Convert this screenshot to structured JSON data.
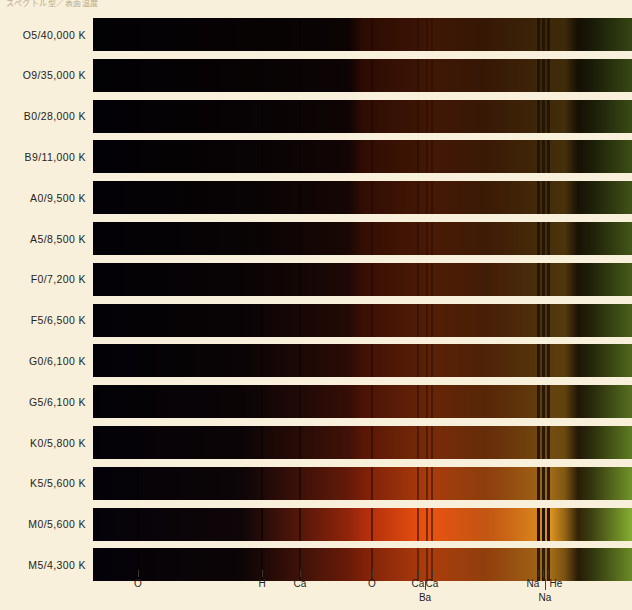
{
  "header": {
    "cropped_text": "スペクトル型／表面温度"
  },
  "chart_data": {
    "type": "heatmap",
    "xlabel": "",
    "ylabel": "Spectral type / Surface temperature",
    "grid": false,
    "legend": "none",
    "wavelength_axis_note": "violet (left) to red/green rendering (right)",
    "categories": [
      "O5/40,000 K",
      "O9/35,000 K",
      "B0/28,000 K",
      "B9/11,000 K",
      "A0/9,500 K",
      "A5/8,500 K",
      "F0/7,200 K",
      "F5/6,500 K",
      "G0/6,100 K",
      "G5/6,100 K",
      "K0/5,800 K",
      "K5/5,600 K",
      "M0/5,600 K",
      "M5/4,300 K"
    ],
    "absorption_lines": [
      {
        "element": "O",
        "x": 138,
        "row": 1
      },
      {
        "element": "H",
        "x": 262,
        "row": 1
      },
      {
        "element": "Ca",
        "x": 300,
        "row": 1
      },
      {
        "element": "O",
        "x": 372,
        "row": 1
      },
      {
        "element": "Ca",
        "x": 418,
        "row": 1
      },
      {
        "element": "Ca",
        "x": 432,
        "row": 1
      },
      {
        "element": "Ba",
        "x": 425,
        "row": 2
      },
      {
        "element": "Na",
        "x": 533,
        "row": 1
      },
      {
        "element": "He",
        "x": 556,
        "row": 1
      },
      {
        "element": "Na",
        "x": 545,
        "row": 2
      }
    ],
    "tick_positions": [
      138,
      262,
      300,
      372,
      418,
      427,
      432,
      538,
      543,
      548
    ],
    "series": [
      {
        "name": "O5/40,000 K",
        "temperature_k": 40000,
        "class": "O5",
        "brightness": 0.14,
        "red_strength": 0.1
      },
      {
        "name": "O9/35,000 K",
        "temperature_k": 35000,
        "class": "O9",
        "brightness": 0.16,
        "red_strength": 0.12
      },
      {
        "name": "B0/28,000 K",
        "temperature_k": 28000,
        "class": "B0",
        "brightness": 0.18,
        "red_strength": 0.14
      },
      {
        "name": "B9/11,000 K",
        "temperature_k": 11000,
        "class": "B9",
        "brightness": 0.21,
        "red_strength": 0.18
      },
      {
        "name": "A0/9,500 K",
        "temperature_k": 9500,
        "class": "A0",
        "brightness": 0.24,
        "red_strength": 0.22
      },
      {
        "name": "A5/8,500 K",
        "temperature_k": 8500,
        "class": "A5",
        "brightness": 0.27,
        "red_strength": 0.26
      },
      {
        "name": "F0/7,200 K",
        "temperature_k": 7200,
        "class": "F0",
        "brightness": 0.31,
        "red_strength": 0.31
      },
      {
        "name": "F5/6,500 K",
        "temperature_k": 6500,
        "class": "F5",
        "brightness": 0.35,
        "red_strength": 0.36
      },
      {
        "name": "G0/6,100 K",
        "temperature_k": 6100,
        "class": "G0",
        "brightness": 0.4,
        "red_strength": 0.42
      },
      {
        "name": "G5/6,100 K",
        "temperature_k": 6100,
        "class": "G5",
        "brightness": 0.46,
        "red_strength": 0.5
      },
      {
        "name": "K0/5,800 K",
        "temperature_k": 5800,
        "class": "K0",
        "brightness": 0.54,
        "red_strength": 0.6
      },
      {
        "name": "K5/5,600 K",
        "temperature_k": 5600,
        "class": "K5",
        "brightness": 0.72,
        "red_strength": 0.8
      },
      {
        "name": "M0/5,600 K",
        "temperature_k": 5600,
        "class": "M0",
        "brightness": 0.92,
        "red_strength": 1.0
      },
      {
        "name": "M5/4,300 K",
        "temperature_k": 4300,
        "class": "M5",
        "brightness": 0.66,
        "red_strength": 0.9
      }
    ]
  },
  "axis": {
    "row1": [
      {
        "label": "O",
        "x": 138
      },
      {
        "label": "H",
        "x": 262
      },
      {
        "label": "Ca",
        "x": 300
      },
      {
        "label": "O",
        "x": 372
      },
      {
        "label": "Ca",
        "x": 418
      },
      {
        "label": "Ca",
        "x": 432
      },
      {
        "label": "Na",
        "x": 533
      },
      {
        "label": "He",
        "x": 556
      }
    ],
    "row2": [
      {
        "label": "Ba",
        "x": 425
      },
      {
        "label": "Na",
        "x": 545
      }
    ]
  },
  "colors": {
    "background": "#f8f0da",
    "text": "#26231e",
    "tick": "#3a342a"
  }
}
